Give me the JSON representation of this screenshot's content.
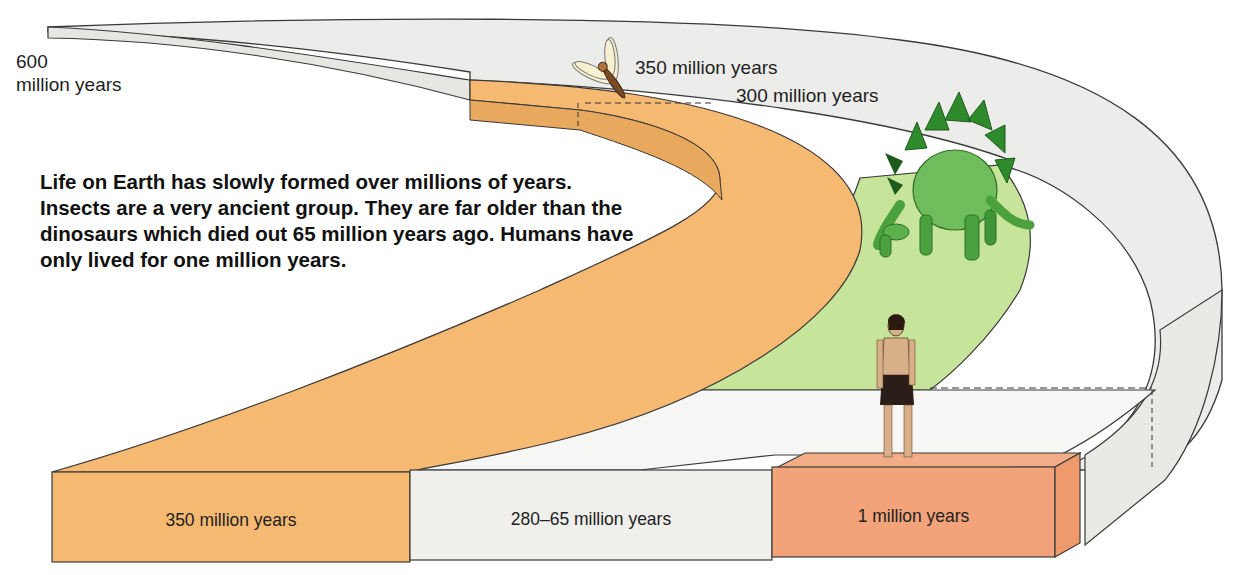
{
  "diagram": {
    "start_label": {
      "line1": "600",
      "line2": "million years"
    },
    "markers": {
      "insects": "350 million years",
      "dinosaurs": "300 million years"
    },
    "intro_text": "Life on Earth has slowly formed over millions of years. Insects are a very ancient group. They are far older than the dinosaurs which died out 65 million years ago. Humans have only lived for one million years.",
    "blocks": [
      {
        "label": "350 million years",
        "group": "Insects",
        "color": "#f5b971"
      },
      {
        "label": "280–65 million years",
        "group": "Dinosaurs",
        "color": "#efefec"
      },
      {
        "label": "1 million years",
        "group": "Humans",
        "color": "#f2a37a"
      }
    ],
    "figures": [
      {
        "name": "insect",
        "icon": "dragonfly-icon"
      },
      {
        "name": "dinosaur",
        "icon": "stegosaurus-icon"
      },
      {
        "name": "human",
        "icon": "human-icon"
      }
    ],
    "colors": {
      "ribbon_grey": "#ececea",
      "insect_band": "#f5b971",
      "insect_band_shadow": "#e8a85e",
      "dinosaur_band": "#c6e49a",
      "human_block": "#f2a37a",
      "outline": "#3a3a3a"
    }
  }
}
